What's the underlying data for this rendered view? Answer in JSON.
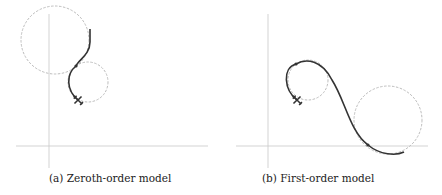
{
  "figure": {
    "panels": [
      {
        "id": "a",
        "caption": "(a) Zeroth-order model",
        "axes": {
          "origin": [
            49,
            146
          ],
          "x_range": [
            16,
            208
          ],
          "y_range": [
            14,
            168
          ]
        },
        "circles": [
          {
            "cx": 55,
            "cy": 40,
            "r": 34,
            "style": "dashed-gray"
          },
          {
            "cx": 88,
            "cy": 82,
            "r": 20,
            "style": "dashed-gray"
          }
        ],
        "path": "M 90 29 L 90 42 C 90 55 76 62 76 66 C 68 72 66 88 78 100",
        "tangent_point": [
          76,
          66
        ],
        "aircraft": {
          "x": 78,
          "y": 100,
          "heading_deg": 225
        }
      },
      {
        "id": "b",
        "caption": "(b) First-order model",
        "axes": {
          "origin": [
            268,
            146
          ],
          "x_range": [
            236,
            428
          ],
          "y_range": [
            14,
            168
          ]
        },
        "circles": [
          {
            "cx": 308,
            "cy": 80,
            "r": 20,
            "style": "dashed-gray"
          },
          {
            "cx": 388,
            "cy": 120,
            "r": 34,
            "style": "dashed-gray"
          }
        ],
        "path": "M 297 100 C 284 90 282 66 296 63 C 306 58 322 60 332 80 C 345 100 350 130 368 145 C 380 156 398 156 404 152",
        "tangent_point_1": [
          296,
          63
        ],
        "tangent_point_2": [
          368,
          145
        ],
        "aircraft": {
          "x": 297,
          "y": 100,
          "heading_deg": 225
        }
      }
    ],
    "colors": {
      "axis": "#c8c8c8",
      "circle": "#bdbdbd",
      "trajectory": "#333333",
      "aircraft": "#333333"
    }
  }
}
